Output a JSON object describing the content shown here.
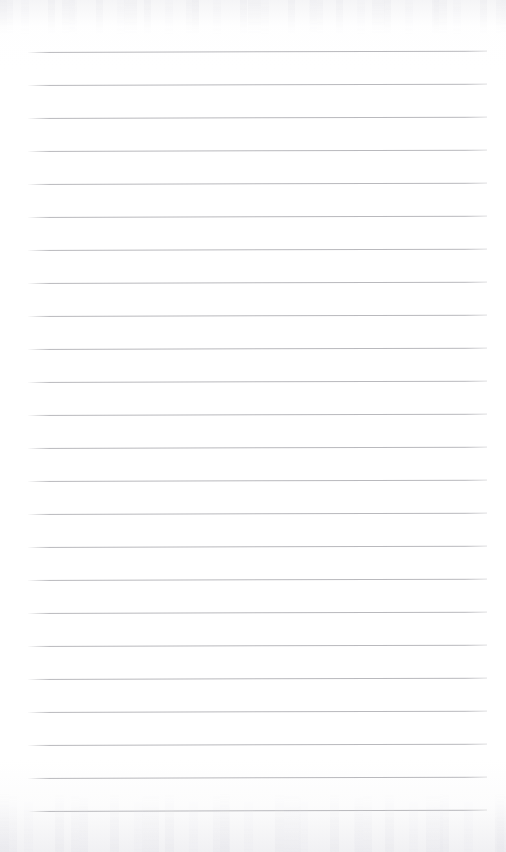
{
  "document": {
    "kind": "lined-paper",
    "title": "",
    "body_text": "",
    "written_content": [],
    "page_number": ""
  },
  "page": {
    "width": 506,
    "height": 852,
    "background_color": "#ffffff",
    "paper_tone_color": "#f3f3f5"
  },
  "ruling": {
    "line_color": "#b9b9bd",
    "line_thickness": 1,
    "line_count": 24,
    "first_line_y": 52,
    "line_spacing": 33,
    "left_margin_x": 28,
    "right_margin_x": 487,
    "line_length": 459,
    "tilt_degrees": -0.16,
    "lines": [
      {
        "index": 1,
        "y": 52
      },
      {
        "index": 2,
        "y": 85
      },
      {
        "index": 3,
        "y": 118
      },
      {
        "index": 4,
        "y": 151
      },
      {
        "index": 5,
        "y": 184
      },
      {
        "index": 6,
        "y": 217
      },
      {
        "index": 7,
        "y": 250
      },
      {
        "index": 8,
        "y": 283
      },
      {
        "index": 9,
        "y": 316
      },
      {
        "index": 10,
        "y": 349
      },
      {
        "index": 11,
        "y": 382
      },
      {
        "index": 12,
        "y": 415
      },
      {
        "index": 13,
        "y": 448
      },
      {
        "index": 14,
        "y": 481
      },
      {
        "index": 15,
        "y": 514
      },
      {
        "index": 16,
        "y": 547
      },
      {
        "index": 17,
        "y": 580
      },
      {
        "index": 18,
        "y": 613
      },
      {
        "index": 19,
        "y": 646
      },
      {
        "index": 20,
        "y": 679
      },
      {
        "index": 21,
        "y": 712
      },
      {
        "index": 22,
        "y": 745
      },
      {
        "index": 23,
        "y": 778
      },
      {
        "index": 24,
        "y": 811
      }
    ]
  },
  "scan_artifacts": {
    "top_band_height": 34,
    "bottom_band_height": 58,
    "noise_color": "#e4e4e9"
  }
}
